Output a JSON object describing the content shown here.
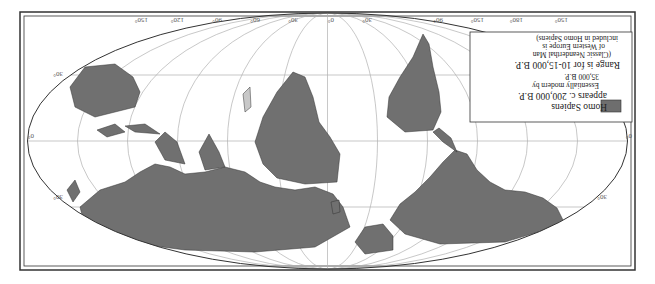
{
  "map": {
    "orientation": "rotated 180 degrees (upside down)",
    "projection": "elliptical world map (Mollweide-like)",
    "land_color": "#707070",
    "light_area_color": "#c8c8c8",
    "grid_color": "#aaaaaa",
    "outline_color": "#333333",
    "longitude_labels": [
      "150°",
      "120°",
      "90°",
      "60°",
      "30°",
      "0°",
      "30°",
      "90°",
      "150°",
      "180°",
      "150°"
    ],
    "latitude_labels": {
      "left": [
        "30°",
        "0°",
        "30°"
      ],
      "right": [
        "30°",
        "0°",
        "30°"
      ]
    }
  },
  "legend": {
    "swatch_color": "#6e6e6e",
    "title_line1": "Homo Sapiens",
    "title_line2": "appears c. 200,000 B.P.",
    "line3": "Essentially modern by",
    "line4": "35,000 B.P.",
    "line5": "Range is for 10-15,000 B.P.",
    "line6": "(Classic Neanderthal Man",
    "line7": "of Western Europe is",
    "line8": "included in Homo Sapiens)"
  }
}
